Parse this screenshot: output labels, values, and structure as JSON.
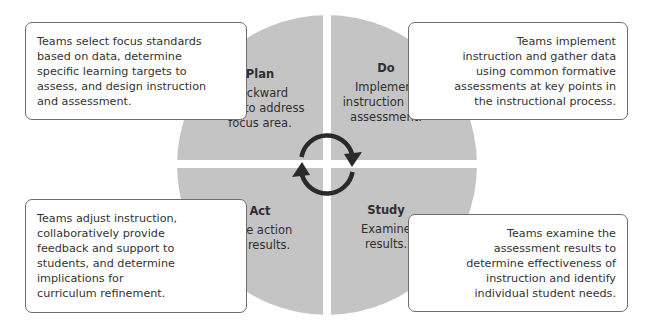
{
  "diagram": {
    "type": "cycle",
    "name": "Plan-Do-Study-Act cycle",
    "colors": {
      "quadrant_fill": "#c4c4c4",
      "arrow": "#2a2a2a",
      "box_border": "#6e6e6e",
      "background": "#ffffff"
    },
    "center_icon": "cycle-arrows-icon",
    "quadrants": [
      {
        "id": "plan",
        "position": "top-left",
        "title": "Plan",
        "body_lines": [
          "Backward",
          "plan to address",
          "focus area."
        ],
        "description_lines": [
          "Teams select focus standards",
          "based on data, determine",
          "specific learning targets to",
          "assess, and design instruction",
          "and assessment."
        ]
      },
      {
        "id": "do",
        "position": "top-right",
        "title": "Do",
        "body_lines": [
          "Implement",
          "instruction and",
          "assessment."
        ],
        "description_lines": [
          "Teams implement",
          "instruction and gather data",
          "using common formative",
          "assessments at key points in",
          "the instructional process."
        ]
      },
      {
        "id": "act",
        "position": "bottom-left",
        "title": "Act",
        "body_lines": [
          "Take action",
          "on results."
        ],
        "description_lines": [
          "Teams adjust instruction,",
          "collaboratively provide",
          "feedback and support to",
          "students, and determine",
          "implications for",
          "curriculum refinement."
        ]
      },
      {
        "id": "study",
        "position": "bottom-right",
        "title": "Study",
        "body_lines": [
          "Examine",
          "results."
        ],
        "description_lines": [
          "Teams examine the",
          "assessment results to",
          "determine effectiveness of",
          "instruction and identify",
          "individual student needs."
        ]
      }
    ]
  }
}
